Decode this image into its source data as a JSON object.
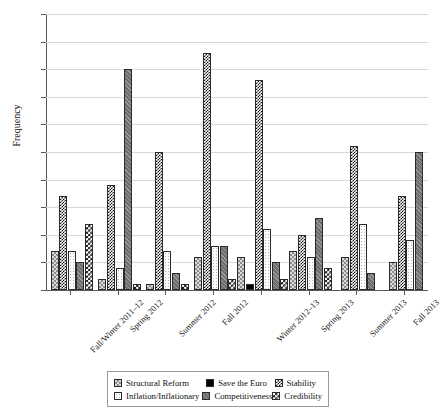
{
  "chart_data": {
    "type": "bar",
    "title": "",
    "xlabel": "",
    "ylabel": "Frequency",
    "ylim": [
      0,
      50
    ],
    "yticks": [
      0,
      5,
      10,
      15,
      20,
      25,
      30,
      35,
      40,
      45,
      50
    ],
    "grid": true,
    "legend_position": "bottom",
    "categories": [
      "Fall/Winter 2011–12",
      "Spring 2012",
      "Summer 2012",
      "Fall 2012",
      "Winter 2012–13",
      "Spring 2013",
      "Summer 2013",
      "Fall 2013"
    ],
    "series": [
      {
        "name": "Structural Reform",
        "pattern": "structural",
        "values": [
          7,
          2,
          1,
          6,
          6,
          7,
          6,
          5
        ]
      },
      {
        "name": "Save the Euro",
        "pattern": "euro",
        "values": [
          0,
          0,
          0,
          0,
          1,
          0,
          0,
          0
        ]
      },
      {
        "name": "Stability",
        "pattern": "stability",
        "values": [
          17,
          19,
          25,
          43,
          38,
          10,
          26,
          17
        ]
      },
      {
        "name": "Inflation/Inflationary",
        "pattern": "inflation",
        "values": [
          7,
          4,
          7,
          8,
          11,
          6,
          12,
          9
        ]
      },
      {
        "name": "Competitiveness",
        "pattern": "competitiveness",
        "values": [
          5,
          40,
          3,
          8,
          5,
          13,
          3,
          25
        ]
      },
      {
        "name": "Credibility",
        "pattern": "credibility",
        "values": [
          12,
          1,
          1,
          2,
          2,
          4,
          0,
          0
        ]
      }
    ]
  },
  "legend": {
    "items": [
      {
        "label": "Structural Reform",
        "pattern": "structural"
      },
      {
        "label": "Save the Euro",
        "pattern": "euro"
      },
      {
        "label": "Stability",
        "pattern": "stability"
      },
      {
        "label": "Inflation/Inflationary",
        "pattern": "inflation"
      },
      {
        "label": "Competitiveness",
        "pattern": "competitiveness"
      },
      {
        "label": "Credibility",
        "pattern": "credibility"
      }
    ]
  }
}
